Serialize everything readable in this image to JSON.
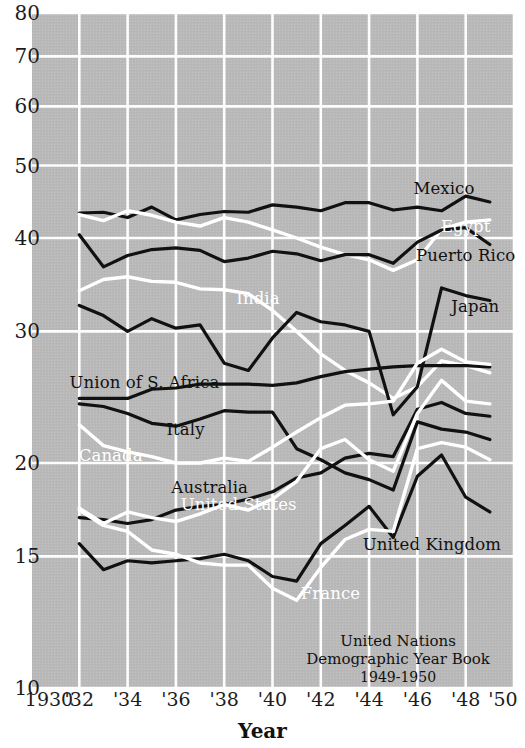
{
  "chart_data": {
    "type": "line",
    "title": "",
    "xlabel": "Year",
    "ylabel": "",
    "yscale": "log",
    "ylim": [
      10,
      80
    ],
    "xlim": [
      1930,
      1950
    ],
    "grid": true,
    "legend": "inline-labels",
    "ytick_labels": [
      "80",
      "70",
      "60",
      "50",
      "40",
      "30",
      "20",
      "15",
      "10"
    ],
    "ytick_values": [
      80,
      70,
      60,
      50,
      40,
      30,
      20,
      15,
      10
    ],
    "xtick_labels": [
      "1930",
      "'32",
      "'34",
      "'36",
      "'38",
      "'40",
      "'42",
      "'44",
      "'46",
      "'48",
      "'50"
    ],
    "xtick_values": [
      1930,
      1932,
      1934,
      1936,
      1938,
      1940,
      1942,
      1944,
      1946,
      1948,
      1950
    ],
    "x": [
      1932,
      1933,
      1934,
      1935,
      1936,
      1937,
      1938,
      1939,
      1940,
      1941,
      1942,
      1943,
      1944,
      1945,
      1946,
      1947,
      1948,
      1949
    ],
    "series": [
      {
        "name": "Mexico",
        "color": "#111111",
        "label_x": 1947.1,
        "label_y": 46.6,
        "values": [
          43.2,
          43.3,
          42.6,
          44.0,
          42.3,
          43.0,
          43.4,
          43.3,
          44.3,
          44.0,
          43.5,
          44.6,
          44.6,
          43.6,
          44.0,
          43.5,
          45.5,
          44.7
        ]
      },
      {
        "name": "Egypt",
        "color": "#ffffff",
        "label_x": 1948.0,
        "label_y": 41.5,
        "values": [
          43.0,
          42.2,
          43.5,
          42.9,
          42.0,
          41.5,
          42.6,
          42.0,
          41.0,
          40.0,
          38.9,
          38.0,
          37.4,
          36.2,
          37.4,
          41.1,
          42.0,
          42.3
        ]
      },
      {
        "name": "Puerto Rico",
        "color": "#111111",
        "label_x": 1948.0,
        "label_y": 38.0,
        "values": [
          40.4,
          36.6,
          37.9,
          38.6,
          38.8,
          38.5,
          37.2,
          37.6,
          38.4,
          38.1,
          37.3,
          38.0,
          38.0,
          37.0,
          39.5,
          41.0,
          41.3,
          39.2
        ]
      },
      {
        "name": "India",
        "color": "#ffffff",
        "label_x": 1939.4,
        "label_y": 33.2,
        "values": [
          34.0,
          35.2,
          35.5,
          35.0,
          34.9,
          34.2,
          34.1,
          33.7,
          32.0,
          30.0,
          28.0,
          26.6,
          25.6,
          24.4,
          25.3,
          27.4,
          27.0,
          26.4
        ]
      },
      {
        "name": "Japan",
        "color": "#111111",
        "label_x": 1948.4,
        "label_y": 32.4,
        "values": [
          32.5,
          31.5,
          30.0,
          31.2,
          30.3,
          30.6,
          27.2,
          26.6,
          29.4,
          31.8,
          30.9,
          30.6,
          30.0,
          23.2,
          25.3,
          34.3,
          33.5,
          33.0
        ]
      },
      {
        "name": "Union of S. Africa",
        "color": "#111111",
        "label_x": 1934.7,
        "label_y": 25.7,
        "values": [
          24.4,
          24.4,
          24.4,
          25.1,
          25.2,
          25.5,
          25.5,
          25.5,
          25.4,
          25.6,
          26.1,
          26.5,
          26.7,
          26.9,
          27.0,
          27.0,
          27.0,
          26.9
        ]
      },
      {
        "name": "Italy",
        "color": "#111111",
        "label_x": 1936.4,
        "label_y": 22.2,
        "values": [
          24.0,
          23.8,
          23.3,
          22.6,
          22.4,
          22.9,
          23.5,
          23.4,
          23.4,
          20.9,
          20.2,
          19.4,
          19.0,
          18.4,
          22.7,
          22.2,
          22.0,
          21.5
        ]
      },
      {
        "name": "Canada",
        "color": "#ffffff",
        "label_x": 1933.3,
        "label_y": 20.5,
        "values": [
          22.5,
          21.1,
          20.7,
          20.4,
          20.0,
          20.0,
          20.3,
          20.1,
          21.0,
          22.0,
          23.0,
          23.9,
          24.0,
          24.2,
          27.2,
          28.4,
          27.3,
          27.1
        ]
      },
      {
        "name": "Australia",
        "color": "#111111",
        "label_x": 1937.4,
        "label_y": 18.6,
        "values": [
          16.9,
          16.8,
          16.6,
          16.8,
          17.3,
          17.5,
          17.6,
          17.9,
          18.3,
          19.1,
          19.4,
          20.3,
          20.6,
          20.4,
          23.6,
          24.1,
          23.3,
          23.1
        ]
      },
      {
        "name": "United States",
        "color": "#ffffff",
        "label_x": 1938.6,
        "label_y": 17.6,
        "values": [
          17.4,
          16.6,
          17.2,
          16.9,
          16.7,
          17.1,
          17.6,
          17.3,
          17.9,
          18.9,
          20.9,
          21.5,
          20.2,
          19.5,
          23.3,
          25.8,
          24.2,
          24.0
        ]
      },
      {
        "name": "United Kingdom",
        "color": "#111111",
        "label_x": 1946.6,
        "label_y": 15.6,
        "values": [
          15.6,
          14.4,
          14.8,
          14.7,
          14.8,
          14.9,
          15.1,
          14.8,
          14.1,
          13.9,
          15.6,
          16.5,
          17.5,
          15.9,
          19.2,
          20.5,
          18.0,
          17.2
        ]
      },
      {
        "name": "France",
        "color": "#ffffff",
        "label_x": 1942.4,
        "label_y": 13.4,
        "values": [
          17.3,
          16.5,
          16.2,
          15.3,
          15.1,
          14.7,
          14.6,
          14.6,
          13.6,
          13.1,
          14.5,
          15.8,
          16.3,
          16.2,
          20.9,
          21.3,
          21.0,
          20.2
        ]
      }
    ],
    "source_note": {
      "line1": "United Nations",
      "line2": "Demographic Year Book",
      "line3": "1949-1950",
      "x": 1945.2,
      "y": 11.9
    }
  }
}
